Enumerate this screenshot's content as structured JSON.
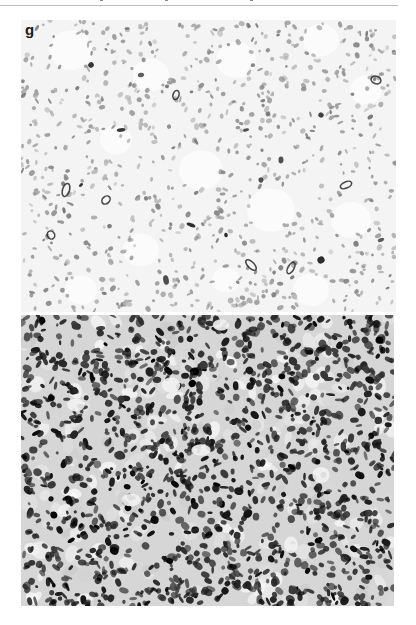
{
  "figure": {
    "panel_label": "g",
    "colors": {
      "page_background": "#ffffff",
      "top_rule": "#bdbdbd",
      "upper_panel_background": "#f4f4f4",
      "upper_panel_nuclei": "#8c8c8c",
      "upper_panel_dark_cells": "#2a2a2a",
      "lower_panel_background": "#d6d6d6",
      "lower_panel_stain": "#111111"
    },
    "panels": [
      {
        "id": "upper",
        "description": "Light-stained histology micrograph with sparse small nuclei, scattered dark-stained cells and pale vacuole-like clearings",
        "x": 21,
        "y": 20,
        "width": 375,
        "height": 292
      },
      {
        "id": "lower",
        "description": "Densely stained histology micrograph with abundant dark positive cells",
        "x": 21,
        "y": 315,
        "width": 373,
        "height": 291
      }
    ]
  }
}
